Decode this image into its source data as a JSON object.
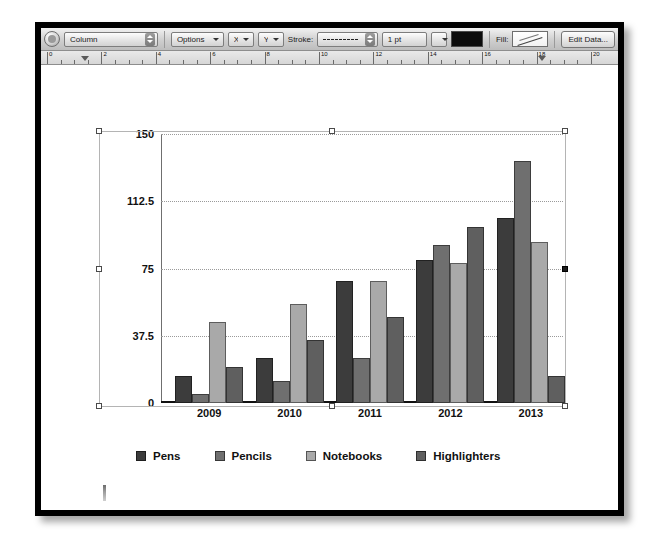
{
  "toolbar": {
    "chart_type_value": "Column",
    "options_label": "Options",
    "x_label": "X",
    "y_label": "Y",
    "stroke_label": "Stroke:",
    "stroke_style_value": "",
    "stroke_weight_value": "1 pt",
    "stroke_color": "#0c0c0c",
    "fill_label": "Fill:",
    "edit_data_label": "Edit Data...",
    "round_button_name": "shape-mode-button"
  },
  "ruler": {
    "unit_labels": [
      "0",
      "2",
      "4",
      "6",
      "8",
      "10",
      "12",
      "14",
      "16",
      "18",
      "20"
    ],
    "marker_positions": [
      1.4,
      18.2
    ]
  },
  "chart_data": {
    "type": "bar",
    "title": "",
    "xlabel": "",
    "ylabel": "",
    "categories": [
      "2009",
      "2010",
      "2011",
      "2012",
      "2013"
    ],
    "ylim": [
      0,
      150
    ],
    "yticks": [
      "0",
      "37.5",
      "75",
      "112.5",
      "150"
    ],
    "ytick_values": [
      0,
      37.5,
      75,
      112.5,
      150
    ],
    "grid": true,
    "legend_position": "bottom",
    "series": [
      {
        "name": "Pens",
        "color": "#3c3c3c",
        "values": [
          15,
          25,
          68,
          80,
          103
        ]
      },
      {
        "name": "Pencils",
        "color": "#6f6f6f",
        "values": [
          5,
          12,
          25,
          88,
          135
        ]
      },
      {
        "name": "Notebooks",
        "color": "#a9a9a9",
        "values": [
          45,
          55,
          68,
          78,
          90
        ]
      },
      {
        "name": "Highlighters",
        "color": "#5f5f5f",
        "values": [
          20,
          35,
          48,
          98,
          15
        ]
      }
    ]
  },
  "selection": {
    "handle_count": 8,
    "active_handle": "middle-right"
  }
}
